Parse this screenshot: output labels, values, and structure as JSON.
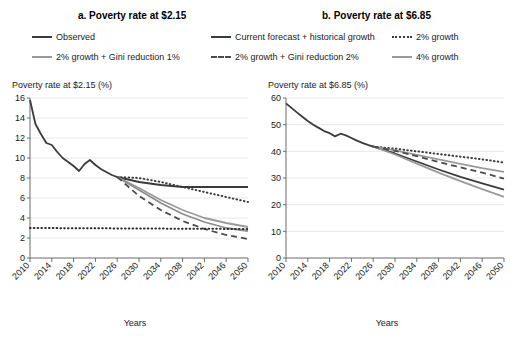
{
  "figure": {
    "panels": [
      {
        "id": "a",
        "title": "a. Poverty rate at $2.15",
        "ylabel": "Poverty rate at $2.15 (%)",
        "xlabel": "Years"
      },
      {
        "id": "b",
        "title": "b. Poverty rate at $6.85",
        "ylabel": "Poverty rate at $6.85 (%)",
        "xlabel": "Years"
      }
    ]
  },
  "legend": {
    "position": "top",
    "items": [
      {
        "key": "observed",
        "label": "Observed",
        "style": "solid",
        "color": "#3b3b3b"
      },
      {
        "key": "gini1",
        "label": "2% growth + Gini reduction 1%",
        "style": "solid",
        "color": "#9a9a9a"
      },
      {
        "key": "current",
        "label": "Current forecast + historical growth",
        "style": "solid",
        "color": "#3b3b3b"
      },
      {
        "key": "gini2",
        "label": "2% growth + Gini reduction 2%",
        "style": "dashed",
        "color": "#4a4a4a"
      },
      {
        "key": "growth2",
        "label": "2% growth",
        "style": "dotted",
        "color": "#3b3b3b"
      },
      {
        "key": "growth4",
        "label": "4% growth",
        "style": "solid",
        "color": "#9a9a9a"
      }
    ]
  },
  "chart_data": [
    {
      "type": "line",
      "title": "a. Poverty rate at $2.15",
      "xlabel": "Years",
      "ylabel": "Poverty rate at $2.15 (%)",
      "xlim": [
        2010,
        2050
      ],
      "ylim": [
        0,
        16
      ],
      "yticks": [
        0,
        2,
        4,
        6,
        8,
        10,
        12,
        14,
        16
      ],
      "xticks": [
        2010,
        2014,
        2018,
        2022,
        2026,
        2030,
        2034,
        2038,
        2042,
        2046,
        2050
      ],
      "grid": "horizontal",
      "series": [
        {
          "name": "Observed",
          "style": "solid",
          "color": "#3b3b3b",
          "x": [
            2010,
            2011,
            2012,
            2013,
            2014,
            2015,
            2016,
            2017,
            2018,
            2019,
            2020,
            2021,
            2022,
            2023,
            2024,
            2025,
            2026
          ],
          "values": [
            15.8,
            13.4,
            12.4,
            11.5,
            11.3,
            10.6,
            10.0,
            9.6,
            9.2,
            8.7,
            9.4,
            9.8,
            9.3,
            8.9,
            8.6,
            8.3,
            8.1
          ]
        },
        {
          "name": "Current forecast + historical growth",
          "style": "solid",
          "color": "#3b3b3b",
          "x": [
            2026,
            2030,
            2034,
            2038,
            2042,
            2046,
            2050
          ],
          "values": [
            8.1,
            7.6,
            7.3,
            7.1,
            7.1,
            7.1,
            7.1
          ]
        },
        {
          "name": "2% growth",
          "style": "dotted",
          "color": "#3b3b3b",
          "x": [
            2026,
            2030,
            2034,
            2038,
            2042,
            2046,
            2050
          ],
          "values": [
            8.1,
            8.0,
            7.6,
            7.1,
            6.6,
            6.1,
            5.6
          ]
        },
        {
          "name": "4% growth",
          "style": "solid",
          "color": "#9a9a9a",
          "x": [
            2026,
            2030,
            2034,
            2038,
            2042,
            2046,
            2050
          ],
          "values": [
            8.1,
            7.0,
            5.8,
            4.8,
            4.0,
            3.5,
            3.1
          ]
        },
        {
          "name": "2% growth + Gini reduction 1%",
          "style": "solid",
          "color": "#8d8d8d",
          "x": [
            2026,
            2030,
            2034,
            2038,
            2042,
            2046,
            2050
          ],
          "values": [
            8.1,
            6.8,
            5.5,
            4.4,
            3.6,
            3.0,
            2.7
          ]
        },
        {
          "name": "2% growth + Gini reduction 2%",
          "style": "dashed",
          "color": "#4a4a4a",
          "x": [
            2026,
            2030,
            2034,
            2038,
            2042,
            2046,
            2050
          ],
          "values": [
            8.1,
            6.2,
            4.8,
            3.7,
            2.9,
            2.3,
            1.9
          ]
        },
        {
          "name": "Extreme poverty floor",
          "style": "dotted",
          "color": "#2b2b2b",
          "x": [
            2010,
            2050
          ],
          "values": [
            3.0,
            2.9
          ]
        }
      ]
    },
    {
      "type": "line",
      "title": "b. Poverty rate at $6.85",
      "xlabel": "Years",
      "ylabel": "Poverty rate at $6.85 (%)",
      "xlim": [
        2010,
        2050
      ],
      "ylim": [
        0,
        60
      ],
      "yticks": [
        0,
        10,
        20,
        30,
        40,
        50,
        60
      ],
      "xticks": [
        2010,
        2014,
        2018,
        2022,
        2026,
        2030,
        2034,
        2038,
        2042,
        2046,
        2050
      ],
      "grid": "horizontal",
      "series": [
        {
          "name": "Observed",
          "style": "solid",
          "color": "#3b3b3b",
          "x": [
            2010,
            2011,
            2012,
            2013,
            2014,
            2015,
            2016,
            2017,
            2018,
            2019,
            2020,
            2021,
            2022,
            2023,
            2024,
            2025,
            2026
          ],
          "values": [
            58.0,
            56.3,
            54.6,
            53.0,
            51.4,
            50.0,
            48.8,
            47.6,
            46.8,
            45.6,
            46.6,
            46.0,
            45.0,
            44.0,
            43.2,
            42.4,
            41.8
          ]
        },
        {
          "name": "Current forecast + historical growth",
          "style": "solid",
          "color": "#3b3b3b",
          "x": [
            2026,
            2030,
            2034,
            2038,
            2042,
            2046,
            2050
          ],
          "values": [
            41.8,
            39.2,
            36.2,
            33.2,
            30.4,
            28.0,
            25.6
          ]
        },
        {
          "name": "2% growth",
          "style": "dotted",
          "color": "#3b3b3b",
          "x": [
            2026,
            2030,
            2034,
            2038,
            2042,
            2046,
            2050
          ],
          "values": [
            41.8,
            41.0,
            40.0,
            39.0,
            38.0,
            37.0,
            35.8
          ]
        },
        {
          "name": "4% growth",
          "style": "solid",
          "color": "#9a9a9a",
          "x": [
            2026,
            2030,
            2034,
            2038,
            2042,
            2046,
            2050
          ],
          "values": [
            41.8,
            40.4,
            38.7,
            37.0,
            35.3,
            33.7,
            32.3
          ]
        },
        {
          "name": "2% growth + Gini reduction 1%",
          "style": "solid",
          "color": "#9a9a9a",
          "x": [
            2026,
            2030,
            2034,
            2038,
            2042,
            2046,
            2050
          ],
          "values": [
            41.8,
            38.8,
            35.4,
            32.0,
            28.8,
            25.8,
            22.9
          ]
        },
        {
          "name": "2% growth + Gini reduction 2%",
          "style": "dashed",
          "color": "#4a4a4a",
          "x": [
            2026,
            2030,
            2034,
            2038,
            2042,
            2046,
            2050
          ],
          "values": [
            41.8,
            40.2,
            38.2,
            36.0,
            34.0,
            32.0,
            29.8
          ]
        }
      ]
    }
  ]
}
